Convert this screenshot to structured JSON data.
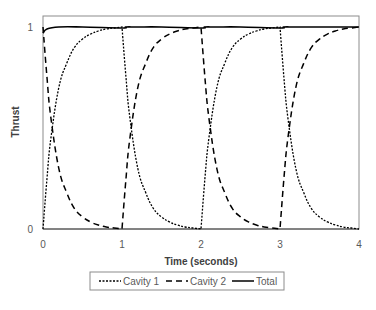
{
  "chart_data": {
    "type": "line",
    "title": "",
    "xlabel": "Time (seconds)",
    "ylabel": "Thrust",
    "xlim": [
      0,
      4
    ],
    "ylim": [
      0,
      1
    ],
    "xticks": [
      "0",
      "1",
      "2",
      "3",
      "4"
    ],
    "yticks": [
      "0",
      "1"
    ],
    "grid": false,
    "legend_position": "bottom",
    "series": [
      {
        "name": "Cavity 1",
        "style": "dotted",
        "color": "#000000",
        "x": [
          0,
          0.05,
          0.1,
          0.2,
          0.3,
          0.4,
          0.5,
          0.6,
          0.7,
          0.8,
          0.9,
          1.0,
          1.05,
          1.1,
          1.2,
          1.3,
          1.4,
          1.5,
          1.6,
          1.7,
          1.8,
          1.9,
          2.0,
          2.05,
          2.1,
          2.2,
          2.3,
          2.4,
          2.5,
          2.6,
          2.7,
          2.8,
          2.9,
          3.0,
          3.05,
          3.1,
          3.2,
          3.3,
          3.4,
          3.5,
          3.6,
          3.7,
          3.8,
          3.9,
          4.0
        ],
        "values": [
          0,
          0.25,
          0.45,
          0.7,
          0.82,
          0.9,
          0.94,
          0.965,
          0.98,
          0.99,
          0.995,
          1.0,
          0.75,
          0.55,
          0.3,
          0.18,
          0.1,
          0.06,
          0.035,
          0.02,
          0.01,
          0.005,
          0,
          0.25,
          0.45,
          0.7,
          0.82,
          0.9,
          0.94,
          0.965,
          0.98,
          0.99,
          0.995,
          1.0,
          0.75,
          0.55,
          0.3,
          0.18,
          0.1,
          0.06,
          0.035,
          0.02,
          0.01,
          0.005,
          0
        ]
      },
      {
        "name": "Cavity 2",
        "style": "dashed",
        "color": "#000000",
        "x": [
          0,
          0.05,
          0.1,
          0.2,
          0.3,
          0.4,
          0.5,
          0.6,
          0.7,
          0.8,
          0.9,
          1.0,
          1.05,
          1.1,
          1.2,
          1.3,
          1.4,
          1.5,
          1.6,
          1.7,
          1.8,
          1.9,
          2.0,
          2.05,
          2.1,
          2.2,
          2.3,
          2.4,
          2.5,
          2.6,
          2.7,
          2.8,
          2.9,
          3.0,
          3.05,
          3.1,
          3.2,
          3.3,
          3.4,
          3.5,
          3.6,
          3.7,
          3.8,
          3.9,
          4.0
        ],
        "values": [
          1.0,
          0.75,
          0.55,
          0.3,
          0.18,
          0.1,
          0.06,
          0.035,
          0.02,
          0.01,
          0.005,
          0,
          0.25,
          0.45,
          0.7,
          0.82,
          0.9,
          0.94,
          0.965,
          0.98,
          0.99,
          0.995,
          1.0,
          0.75,
          0.55,
          0.3,
          0.18,
          0.1,
          0.06,
          0.035,
          0.02,
          0.01,
          0.005,
          0,
          0.25,
          0.45,
          0.7,
          0.82,
          0.9,
          0.94,
          0.965,
          0.98,
          0.99,
          0.995,
          1.0
        ]
      },
      {
        "name": "Total",
        "style": "solid",
        "color": "#000000",
        "x": [
          0,
          0.05,
          0.2,
          0.5,
          1.0,
          1.05,
          1.2,
          1.5,
          2.0,
          2.05,
          2.2,
          2.5,
          3.0,
          3.05,
          3.2,
          3.5,
          4.0
        ],
        "values": [
          0.97,
          0.99,
          1.0,
          1.0,
          0.995,
          1.0,
          1.0,
          1.0,
          0.995,
          1.0,
          1.0,
          1.0,
          0.995,
          1.0,
          1.0,
          1.0,
          1.0
        ]
      }
    ]
  },
  "legend": {
    "items": [
      {
        "label": "Cavity 1",
        "style": "dotted"
      },
      {
        "label": "Cavity 2",
        "style": "dashed"
      },
      {
        "label": "Total",
        "style": "solid"
      }
    ]
  },
  "colors": {
    "line": "#000000",
    "frame": "#7f7f7f",
    "tick_text": "#595959",
    "axis_title": "#404040"
  }
}
